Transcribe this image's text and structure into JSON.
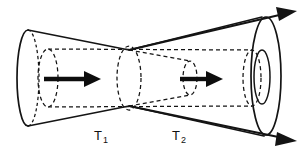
{
  "figure": {
    "background_color": "#ffffff",
    "line_color": "#141414",
    "width": 307,
    "height": 150
  },
  "labels": {
    "region1": {
      "base": "T",
      "subscript": "1",
      "full": "T1",
      "x": 94,
      "y": 138
    },
    "region2": {
      "base": "T",
      "subscript": "2",
      "full": "T2",
      "x": 172,
      "y": 138
    }
  },
  "flow_arrows": [
    {
      "name": "flow-arrow-left",
      "from_x": 44,
      "to_x": 96,
      "y": 79
    },
    {
      "name": "flow-arrow-right",
      "from_x": 176,
      "to_x": 222,
      "y": 79
    }
  ],
  "axis_arrows": [
    {
      "name": "axis-arrow-upper-right",
      "direction": "up-right"
    },
    {
      "name": "axis-arrow-lower-right",
      "direction": "down-right"
    }
  ],
  "shapes": {
    "outer_left_ellipse": {
      "cx": 27,
      "cy": 78,
      "rx": 11,
      "ry": 48
    },
    "outer_right_ellipse": {
      "cx": 266,
      "cy": 76,
      "rx": 15,
      "ry": 59
    },
    "outer_right_inner_ellipse": {
      "cx": 262,
      "cy": 77,
      "rx": 7,
      "ry": 26
    },
    "waist_ellipse": {
      "cx": 129,
      "cy": 78,
      "rx": 12,
      "ry": 32
    },
    "inner_left_ellipse": {
      "cx": 48,
      "cy": 78,
      "rx": 10,
      "ry": 29
    },
    "inner_right_ellipse": {
      "cx": 232,
      "cy": 77,
      "rx": 9,
      "ry": 28
    },
    "inner_mid_ellipse": {
      "cx": 183,
      "cy": 78,
      "rx": 7,
      "ry": 17
    }
  },
  "colors": {
    "ink": "#141414",
    "paper": "#ffffff",
    "arrow": "#0d0d0d"
  }
}
